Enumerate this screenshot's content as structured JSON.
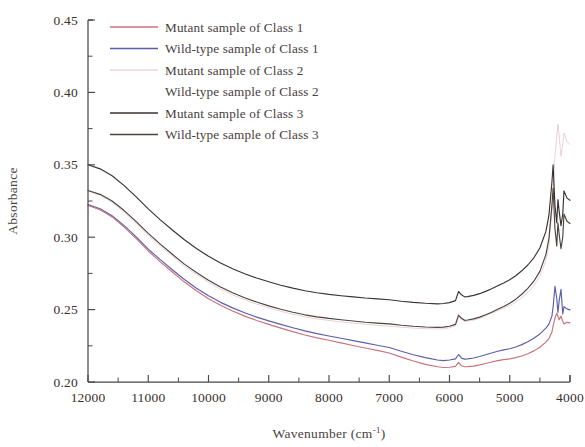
{
  "chart_data": {
    "type": "line",
    "title": "",
    "xlabel": "Wavenumber (cm-1)",
    "xlabel_base": "Wavenumber (cm",
    "xlabel_sup": "-1",
    "xlabel_close": ")",
    "ylabel": "Absorbance",
    "xlim": [
      12000,
      4000
    ],
    "ylim": [
      0.2,
      0.45
    ],
    "x_reversed": true,
    "grid": false,
    "legend_position": "top-left-inside",
    "xticks": [
      12000,
      11000,
      10000,
      9000,
      8000,
      7000,
      6000,
      5000,
      4000
    ],
    "xtick_labels": [
      "12000",
      "11000",
      "10000",
      "9000",
      "8000",
      "7000",
      "6000",
      "5000",
      "4000"
    ],
    "yticks": [
      0.2,
      0.25,
      0.3,
      0.35,
      0.4,
      0.45
    ],
    "ytick_labels": [
      "0.20",
      "0.25",
      "0.30",
      "0.35",
      "0.40",
      "0.45"
    ],
    "yticks_minor": [
      0.225,
      0.275,
      0.325,
      0.375,
      0.425
    ],
    "xticks_minor": [
      11500,
      10500,
      9500,
      8500,
      7500,
      6500,
      5500,
      4500
    ],
    "x": [
      12000,
      11800,
      11600,
      11400,
      11200,
      11000,
      10800,
      10600,
      10400,
      10200,
      10000,
      9800,
      9600,
      9400,
      9200,
      9000,
      8800,
      8600,
      8400,
      8200,
      8000,
      7800,
      7600,
      7400,
      7200,
      7000,
      6800,
      6600,
      6400,
      6200,
      6100,
      6000,
      5900,
      5850,
      5800,
      5750,
      5700,
      5600,
      5500,
      5400,
      5300,
      5200,
      5100,
      5000,
      4900,
      4800,
      4700,
      4600,
      4500,
      4400,
      4350,
      4300,
      4280,
      4250,
      4220,
      4200,
      4180,
      4150,
      4120,
      4100,
      4050,
      4000
    ],
    "series": [
      {
        "name": "Mutant sample of Class 1",
        "color": "#c8737b",
        "legend_has_line": true,
        "values": [
          0.322,
          0.319,
          0.314,
          0.307,
          0.299,
          0.2905,
          0.283,
          0.276,
          0.269,
          0.263,
          0.2575,
          0.253,
          0.249,
          0.2455,
          0.2425,
          0.2398,
          0.2372,
          0.2348,
          0.2325,
          0.2305,
          0.2288,
          0.227,
          0.2252,
          0.2235,
          0.2218,
          0.22,
          0.2172,
          0.2145,
          0.2122,
          0.2105,
          0.21,
          0.2102,
          0.2108,
          0.2135,
          0.2112,
          0.2105,
          0.2106,
          0.211,
          0.2118,
          0.2128,
          0.2138,
          0.2148,
          0.2155,
          0.216,
          0.2168,
          0.218,
          0.2195,
          0.2215,
          0.224,
          0.2275,
          0.23,
          0.2345,
          0.239,
          0.244,
          0.2475,
          0.2455,
          0.243,
          0.2455,
          0.242,
          0.24,
          0.2412,
          0.2408
        ]
      },
      {
        "name": "Wild-type sample of Class 1",
        "color": "#5b5fa8",
        "legend_has_line": true,
        "values": [
          0.3225,
          0.3196,
          0.3148,
          0.308,
          0.3002,
          0.2918,
          0.2845,
          0.2775,
          0.2708,
          0.2648,
          0.2595,
          0.255,
          0.2512,
          0.2478,
          0.2448,
          0.2422,
          0.2398,
          0.2375,
          0.2353,
          0.2334,
          0.2318,
          0.2302,
          0.2286,
          0.227,
          0.2254,
          0.2238,
          0.2212,
          0.2188,
          0.2168,
          0.2152,
          0.2148,
          0.2152,
          0.216,
          0.219,
          0.2165,
          0.2158,
          0.216,
          0.2166,
          0.2176,
          0.2188,
          0.22,
          0.2212,
          0.2222,
          0.223,
          0.2242,
          0.2258,
          0.2278,
          0.2302,
          0.2332,
          0.2372,
          0.24,
          0.2455,
          0.252,
          0.266,
          0.258,
          0.248,
          0.256,
          0.264,
          0.247,
          0.252,
          0.2505,
          0.2498
        ]
      },
      {
        "name": "Mutant sample of Class 2",
        "color": "#e8c9cf",
        "legend_has_line": true,
        "values": [
          0.332,
          0.329,
          0.324,
          0.3172,
          0.3095,
          0.3012,
          0.2938,
          0.2868,
          0.28,
          0.2742,
          0.2688,
          0.2642,
          0.2602,
          0.2568,
          0.2538,
          0.2512,
          0.2488,
          0.2468,
          0.245,
          0.2436,
          0.2425,
          0.2415,
          0.2406,
          0.2398,
          0.2392,
          0.2386,
          0.2378,
          0.2372,
          0.2368,
          0.2366,
          0.2368,
          0.2374,
          0.2388,
          0.2452,
          0.2432,
          0.2418,
          0.242,
          0.2428,
          0.244,
          0.2456,
          0.2474,
          0.2492,
          0.251,
          0.2528,
          0.2552,
          0.2582,
          0.2618,
          0.2665,
          0.273,
          0.284,
          0.294,
          0.318,
          0.332,
          0.356,
          0.37,
          0.378,
          0.37,
          0.356,
          0.364,
          0.372,
          0.366,
          0.364
        ]
      },
      {
        "name": "Wild-type  sample of Class 2",
        "color": "#ffffff",
        "legend_has_line": false,
        "values": [
          0.3322,
          0.3292,
          0.3242,
          0.3174,
          0.3097,
          0.3014,
          0.294,
          0.287,
          0.2802,
          0.2744,
          0.269,
          0.2644,
          0.2604,
          0.257,
          0.254,
          0.2514,
          0.249,
          0.247,
          0.2452,
          0.2438,
          0.2427,
          0.2417,
          0.2408,
          0.24,
          0.2394,
          0.2388,
          0.238,
          0.2374,
          0.237,
          0.2368,
          0.237,
          0.2376,
          0.239,
          0.2454,
          0.2434,
          0.242,
          0.2422,
          0.243,
          0.2442,
          0.2458,
          0.2476,
          0.2494,
          0.2512,
          0.253,
          0.2554,
          0.2584,
          0.262,
          0.2667,
          0.2732,
          0.2842,
          0.2942,
          0.3182,
          0.3322,
          0.3562,
          0.3702,
          0.3782,
          0.3702,
          0.3562,
          0.3642,
          0.3722,
          0.3662,
          0.3642
        ]
      },
      {
        "name": "Mutant sample of Class 3",
        "color": "#3b3330",
        "legend_has_line": true,
        "values": [
          0.35,
          0.3472,
          0.3424,
          0.3356,
          0.3278,
          0.3196,
          0.312,
          0.305,
          0.2982,
          0.2922,
          0.2868,
          0.2822,
          0.2782,
          0.2748,
          0.2718,
          0.2692,
          0.2668,
          0.2648,
          0.263,
          0.2616,
          0.2605,
          0.2596,
          0.2588,
          0.258,
          0.2574,
          0.2568,
          0.2558,
          0.255,
          0.2544,
          0.254,
          0.2542,
          0.2548,
          0.2562,
          0.2625,
          0.2602,
          0.2588,
          0.259,
          0.2598,
          0.261,
          0.2626,
          0.2644,
          0.2664,
          0.2684,
          0.2706,
          0.2734,
          0.2768,
          0.2808,
          0.2858,
          0.2925,
          0.304,
          0.315,
          0.338,
          0.35,
          0.322,
          0.31,
          0.326,
          0.318,
          0.308,
          0.316,
          0.332,
          0.327,
          0.3255
        ]
      },
      {
        "name": "Wild-type sample of Class 3",
        "color": "#4b4340",
        "legend_has_line": true,
        "values": [
          0.3322,
          0.3296,
          0.325,
          0.3184,
          0.3108,
          0.3026,
          0.2952,
          0.2882,
          0.2814,
          0.2756,
          0.2702,
          0.2656,
          0.2616,
          0.2582,
          0.2552,
          0.2526,
          0.2502,
          0.2482,
          0.2464,
          0.245,
          0.2439,
          0.243,
          0.2421,
          0.2413,
          0.2407,
          0.2401,
          0.2392,
          0.2385,
          0.238,
          0.2377,
          0.2379,
          0.2385,
          0.2398,
          0.2462,
          0.244,
          0.2426,
          0.2428,
          0.2436,
          0.2448,
          0.2464,
          0.2482,
          0.2502,
          0.2522,
          0.2544,
          0.2572,
          0.2606,
          0.2646,
          0.2696,
          0.2764,
          0.288,
          0.299,
          0.322,
          0.334,
          0.306,
          0.294,
          0.31,
          0.302,
          0.292,
          0.3,
          0.316,
          0.311,
          0.3095
        ]
      }
    ]
  }
}
